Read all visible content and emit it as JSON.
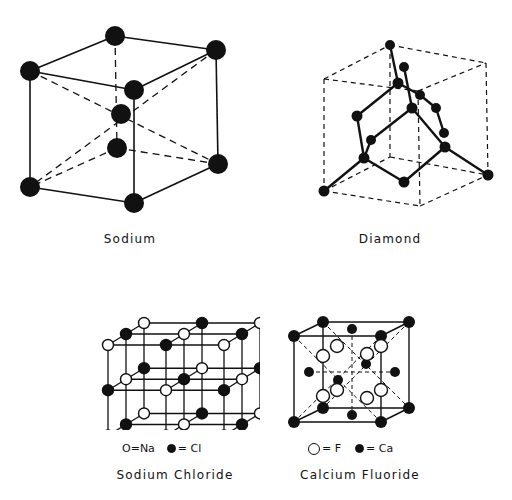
{
  "figure": {
    "panels": [
      {
        "id": "sodium",
        "caption": "Sodium",
        "lattice": "body-centered cubic"
      },
      {
        "id": "diamond",
        "caption": "Diamond",
        "lattice": "diamond cubic"
      },
      {
        "id": "sodium_chloride",
        "caption": "Sodium Chloride",
        "lattice": "rock salt",
        "legend": [
          {
            "symbol": "open-circle",
            "text": "O=Na"
          },
          {
            "symbol": "filled-circle",
            "text": "= Cl"
          }
        ]
      },
      {
        "id": "calcium_fluoride",
        "caption": "Calcium Fluoride",
        "lattice": "fluorite",
        "legend": [
          {
            "symbol": "open-circle",
            "text": "= F"
          },
          {
            "symbol": "filled-circle",
            "text": "= Ca"
          }
        ]
      }
    ]
  },
  "labels": {
    "sodium": "Sodium",
    "diamond": "Diamond",
    "nacl": "Sodium Chloride",
    "caf2": "Calcium Fluoride",
    "nacl_legend_na": "O=Na",
    "nacl_legend_cl": "= Cl",
    "caf2_legend_f": "= F",
    "caf2_legend_ca": "= Ca"
  }
}
